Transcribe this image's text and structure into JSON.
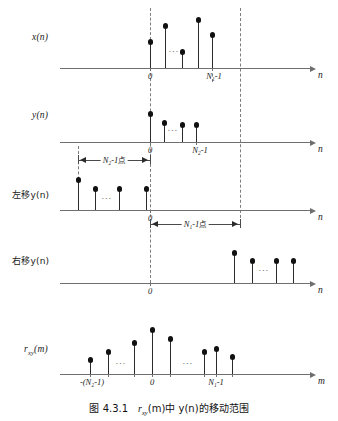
{
  "figure": {
    "caption_number": "图 4.3.1",
    "caption_text_1": "r",
    "caption_sub_1": "xy",
    "caption_text_2": "(m)中 y(n)的移动范围",
    "caption_full": "图 4.3.1   r xy (m)中 y(n)的移动范围"
  },
  "panels": [
    {
      "id": "panel-xn",
      "signal_label": "x(n)",
      "axis_name": "n",
      "tick_labels": [
        "0",
        "N₁-1"
      ],
      "ellipsis": "...",
      "stems": [
        {
          "x": 150,
          "height": 26
        },
        {
          "x": 165,
          "height": 42
        },
        {
          "x": 182,
          "height": 16
        },
        {
          "x": 198,
          "height": 48
        },
        {
          "x": 212,
          "height": 33
        }
      ]
    },
    {
      "id": "panel-yn",
      "signal_label": "y(n)",
      "axis_name": "n",
      "tick_labels": [
        "0",
        "N₂-1"
      ],
      "ellipsis": "...",
      "stems": [
        {
          "x": 150,
          "height": 28
        },
        {
          "x": 164,
          "height": 19
        },
        {
          "x": 182,
          "height": 17
        },
        {
          "x": 196,
          "height": 17
        }
      ],
      "dimension": {
        "label_main": "N₂-1",
        "label_unit": "点",
        "from": 78,
        "to": 150
      }
    },
    {
      "id": "panel-left-shift",
      "signal_label": "左移y(n)",
      "axis_name": "n",
      "tick_labels": [
        "0"
      ],
      "ellipsis": "...",
      "stems": [
        {
          "x": 78,
          "height": 30
        },
        {
          "x": 95,
          "height": 21
        },
        {
          "x": 119,
          "height": 21
        },
        {
          "x": 146,
          "height": 21
        }
      ],
      "dimension": {
        "label_main": "N₁-1",
        "label_unit": "点",
        "from": 150,
        "to": 240
      }
    },
    {
      "id": "panel-right-shift",
      "signal_label": "右移y(n)",
      "axis_name": "n",
      "tick_labels": [
        "0"
      ],
      "ellipsis": "...",
      "stems": [
        {
          "x": 234,
          "height": 30
        },
        {
          "x": 252,
          "height": 22
        },
        {
          "x": 276,
          "height": 22
        },
        {
          "x": 293,
          "height": 22
        }
      ]
    },
    {
      "id": "panel-rxy",
      "signal_label": "r",
      "signal_label_sub": "xy",
      "signal_label_tail": "(m)",
      "axis_name": "m",
      "tick_labels": [
        "-(N₂-1)",
        "0",
        "N₁-1"
      ],
      "ellipsis": "...",
      "stems": [
        {
          "x": 90,
          "height": 14
        },
        {
          "x": 108,
          "height": 22
        },
        {
          "x": 134,
          "height": 31
        },
        {
          "x": 152,
          "height": 44
        },
        {
          "x": 170,
          "height": 35
        },
        {
          "x": 204,
          "height": 22
        },
        {
          "x": 216,
          "height": 25
        },
        {
          "x": 232,
          "height": 17
        }
      ]
    }
  ],
  "colors": {
    "axis": "#6f6f6f",
    "stem": "#2b2b2b",
    "dot": "#111111",
    "dashed": "#7d7d7d",
    "text": "#1a1a1a",
    "background": "#ffffff"
  }
}
